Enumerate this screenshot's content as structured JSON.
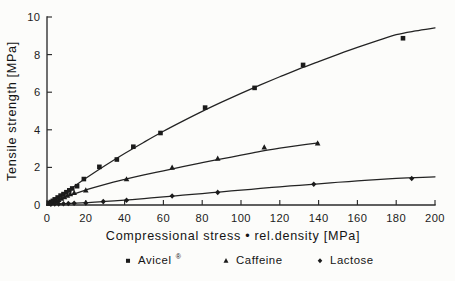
{
  "chart_data": {
    "type": "scatter",
    "title": "",
    "xlabel": "Compressional stress • rel.density [MPa]",
    "ylabel": "Tensile strength [MPa]",
    "xlim": [
      0,
      200
    ],
    "ylim": [
      0,
      10
    ],
    "xticks": [
      0,
      20,
      40,
      60,
      80,
      100,
      120,
      140,
      160,
      180,
      200
    ],
    "yticks": [
      0,
      2,
      4,
      6,
      8,
      10
    ],
    "xtick_labels": [
      "0",
      "20",
      "40",
      "60",
      "80",
      "100",
      "120",
      "140",
      "160",
      "180",
      "200"
    ],
    "ytick_labels": [
      "0",
      "2",
      "4",
      "6",
      "8",
      "10"
    ],
    "grid": false,
    "legend_position": "below",
    "series": [
      {
        "name": "Avicel®",
        "marker": "square",
        "points": [
          [
            1.0,
            0.1
          ],
          [
            2.0,
            0.16
          ],
          [
            3.0,
            0.22
          ],
          [
            4.0,
            0.3
          ],
          [
            5.5,
            0.4
          ],
          [
            7.0,
            0.5
          ],
          [
            8.5,
            0.58
          ],
          [
            10.0,
            0.68
          ],
          [
            11.5,
            0.78
          ],
          [
            13.0,
            0.88
          ],
          [
            15.5,
            1.0
          ],
          [
            19.0,
            1.38
          ],
          [
            27.0,
            2.03
          ],
          [
            36.0,
            2.42
          ],
          [
            44.5,
            3.1
          ],
          [
            58.5,
            3.83
          ],
          [
            81.5,
            5.18
          ],
          [
            107.0,
            6.23
          ],
          [
            132.0,
            7.45
          ],
          [
            183.5,
            8.87
          ]
        ],
        "curve": [
          [
            0,
            0
          ],
          [
            10,
            0.7
          ],
          [
            20,
            1.42
          ],
          [
            30,
            2.1
          ],
          [
            40,
            2.74
          ],
          [
            50,
            3.34
          ],
          [
            60,
            3.92
          ],
          [
            70,
            4.46
          ],
          [
            80,
            4.98
          ],
          [
            90,
            5.47
          ],
          [
            100,
            5.94
          ],
          [
            110,
            6.39
          ],
          [
            120,
            6.82
          ],
          [
            130,
            7.24
          ],
          [
            140,
            7.63
          ],
          [
            150,
            8.01
          ],
          [
            160,
            8.38
          ],
          [
            170,
            8.73
          ],
          [
            180,
            9.06
          ],
          [
            190,
            9.26
          ],
          [
            200,
            9.42
          ]
        ]
      },
      {
        "name": "Caffeine",
        "marker": "triangle",
        "points": [
          [
            1.5,
            0.08
          ],
          [
            3.0,
            0.14
          ],
          [
            4.5,
            0.2
          ],
          [
            6.0,
            0.27
          ],
          [
            7.5,
            0.34
          ],
          [
            9.0,
            0.42
          ],
          [
            10.5,
            0.5
          ],
          [
            12.0,
            0.58
          ],
          [
            14.0,
            0.64
          ],
          [
            20.0,
            0.78
          ],
          [
            41.0,
            1.37
          ],
          [
            64.5,
            1.99
          ],
          [
            88.0,
            2.47
          ],
          [
            112.0,
            3.06
          ],
          [
            139.5,
            3.28
          ]
        ],
        "curve": [
          [
            0,
            0
          ],
          [
            10,
            0.45
          ],
          [
            20,
            0.8
          ],
          [
            30,
            1.1
          ],
          [
            40,
            1.36
          ],
          [
            50,
            1.6
          ],
          [
            60,
            1.82
          ],
          [
            70,
            2.04
          ],
          [
            80,
            2.25
          ],
          [
            90,
            2.45
          ],
          [
            100,
            2.65
          ],
          [
            110,
            2.85
          ],
          [
            120,
            3.02
          ],
          [
            130,
            3.17
          ],
          [
            140,
            3.3
          ]
        ]
      },
      {
        "name": "Lactose",
        "marker": "diamond",
        "points": [
          [
            2.0,
            0.04
          ],
          [
            4.0,
            0.05
          ],
          [
            6.0,
            0.06
          ],
          [
            8.5,
            0.07
          ],
          [
            11.0,
            0.08
          ],
          [
            14.0,
            0.09
          ],
          [
            20.0,
            0.11
          ],
          [
            29.0,
            0.18
          ],
          [
            41.0,
            0.25
          ],
          [
            64.5,
            0.48
          ],
          [
            88.0,
            0.67
          ],
          [
            137.5,
            1.1
          ],
          [
            188.0,
            1.41
          ]
        ],
        "curve": [
          [
            0,
            0
          ],
          [
            10,
            0.07
          ],
          [
            20,
            0.12
          ],
          [
            30,
            0.19
          ],
          [
            40,
            0.26
          ],
          [
            50,
            0.34
          ],
          [
            60,
            0.43
          ],
          [
            70,
            0.52
          ],
          [
            80,
            0.61
          ],
          [
            90,
            0.7
          ],
          [
            100,
            0.79
          ],
          [
            110,
            0.88
          ],
          [
            120,
            0.97
          ],
          [
            130,
            1.05
          ],
          [
            140,
            1.13
          ],
          [
            150,
            1.21
          ],
          [
            160,
            1.28
          ],
          [
            170,
            1.35
          ],
          [
            180,
            1.41
          ],
          [
            190,
            1.46
          ],
          [
            200,
            1.5
          ]
        ]
      }
    ]
  },
  "legend": {
    "items": [
      {
        "label": "Avicel",
        "superscript": "®",
        "marker": "square"
      },
      {
        "label": "Caffeine",
        "superscript": "",
        "marker": "triangle"
      },
      {
        "label": "Lactose",
        "superscript": "",
        "marker": "diamond"
      }
    ]
  },
  "colors": {
    "ink": "#1b1b1b",
    "background": "#fcfcfa",
    "axis": "#2b2b2b"
  }
}
